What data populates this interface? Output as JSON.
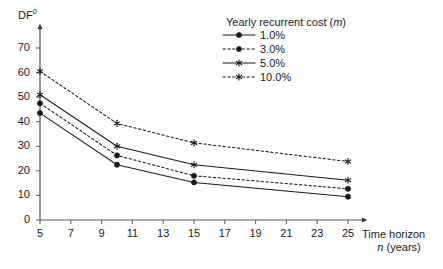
{
  "chart_data": {
    "type": "line",
    "title": "",
    "legend_title": "Yearly recurrent cost (m)",
    "legend_position": "top-right",
    "grid": false,
    "xlabel_line1": "Time horizon",
    "xlabel_line2": "n (years)",
    "ylabel": "DF",
    "ylabel_superscript": "0",
    "x": [
      5,
      10,
      15,
      25
    ],
    "xlim": [
      5,
      25
    ],
    "ylim": [
      0,
      78
    ],
    "xticks": [
      5,
      7,
      9,
      11,
      13,
      15,
      17,
      19,
      21,
      23,
      25
    ],
    "xtick_labels": [
      "5",
      "7",
      "9",
      "11",
      "13",
      "15",
      "17",
      "19",
      "21",
      "23",
      "25"
    ],
    "yticks": [
      0,
      10,
      20,
      30,
      40,
      50,
      60,
      70
    ],
    "ytick_labels": [
      "0",
      "10",
      "20",
      "30",
      "40",
      "50",
      "60",
      "70"
    ],
    "series": [
      {
        "name": "1.0%",
        "label": "1.0%",
        "linestyle": "solid",
        "marker": "circle",
        "color": "#1a1a1a",
        "values": [
          43.5,
          22.5,
          15.3,
          9.5
        ]
      },
      {
        "name": "3.0%",
        "label": "3.0%",
        "linestyle": "dashed",
        "marker": "circle",
        "color": "#1a1a1a",
        "values": [
          47.5,
          26.3,
          18.0,
          12.7
        ]
      },
      {
        "name": "5.0%",
        "label": "5.0%",
        "linestyle": "solid",
        "marker": "star",
        "color": "#1a1a1a",
        "values": [
          51.0,
          30.0,
          22.5,
          16.2
        ]
      },
      {
        "name": "10.0%",
        "label": "10.0%",
        "linestyle": "dashed",
        "marker": "star",
        "color": "#1a1a1a",
        "values": [
          60.5,
          39.3,
          31.4,
          23.8
        ]
      }
    ]
  }
}
